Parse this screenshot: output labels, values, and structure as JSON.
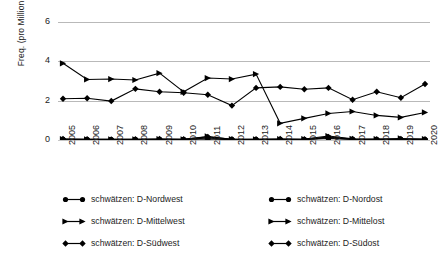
{
  "axes": {
    "ylabel": "Freq. (pro Million Tokens)",
    "yticks": [
      "0",
      "2",
      "4",
      "6"
    ],
    "xticks": [
      "2005",
      "2006",
      "2007",
      "2008",
      "2009",
      "2010",
      "2011",
      "2012",
      "2013",
      "2014",
      "2015",
      "2016",
      "2017",
      "2018",
      "2019",
      "2020"
    ]
  },
  "legend": {
    "items": [
      {
        "label": "schwätzen: D-Nordwest",
        "marker": "circle-marker",
        "column": "left"
      },
      {
        "label": "schwätzen: D-Mittelwest",
        "marker": "triangle-right-marker",
        "column": "left"
      },
      {
        "label": "schwätzen: D-Südwest",
        "marker": "diamond-marker",
        "column": "left"
      },
      {
        "label": "schwätzen: D-Nordost",
        "marker": "circle-marker",
        "column": "right"
      },
      {
        "label": "schwätzen: D-Mittelost",
        "marker": "triangle-right-marker",
        "column": "right"
      },
      {
        "label": "schwätzen: D-Südost",
        "marker": "diamond-marker",
        "column": "right"
      }
    ]
  },
  "colors": {
    "series": "#000000",
    "grid": "#b9b9b9",
    "background": "#ffffff"
  },
  "chart_data": {
    "type": "line",
    "title": "",
    "xlabel": "",
    "ylabel": "Freq. (pro Million Tokens)",
    "x": [
      "2005",
      "2006",
      "2007",
      "2008",
      "2009",
      "2010",
      "2011",
      "2012",
      "2013",
      "2014",
      "2015",
      "2016",
      "2017",
      "2018",
      "2019",
      "2020"
    ],
    "ylim": [
      0,
      6
    ],
    "yticks": [
      0,
      2,
      4,
      6
    ],
    "grid": true,
    "legend_position": "bottom",
    "series": [
      {
        "name": "schwätzen: D-Nordwest",
        "marker": "circle",
        "values": [
          0.03,
          0.02,
          0.02,
          0.02,
          0.03,
          0.02,
          0.05,
          0.02,
          0.02,
          0.03,
          0.02,
          0.08,
          0.03,
          0.02,
          0.02,
          0.02
        ]
      },
      {
        "name": "schwätzen: D-Mittelwest",
        "marker": "triangle-right",
        "values": [
          3.9,
          3.08,
          3.1,
          3.05,
          3.4,
          2.45,
          3.15,
          3.1,
          3.35,
          0.85,
          1.1,
          1.35,
          1.45,
          1.25,
          1.15,
          1.4
        ]
      },
      {
        "name": "schwätzen: D-Südwest",
        "marker": "diamond",
        "values": [
          2.1,
          2.12,
          1.98,
          2.6,
          2.45,
          2.4,
          2.3,
          1.75,
          2.65,
          2.7,
          2.58,
          2.65,
          2.05,
          2.45,
          2.15,
          2.85
        ]
      },
      {
        "name": "schwätzen: D-Nordost",
        "marker": "circle",
        "values": [
          0.02,
          0.02,
          0.01,
          0.02,
          0.02,
          0.02,
          0.1,
          0.02,
          0.02,
          0.02,
          0.02,
          0.12,
          0.03,
          0.02,
          0.02,
          0.02
        ]
      },
      {
        "name": "schwätzen: D-Mittelost",
        "marker": "triangle-right",
        "values": [
          0.04,
          0.03,
          0.03,
          0.03,
          0.04,
          0.03,
          0.18,
          0.04,
          0.03,
          0.04,
          0.05,
          0.2,
          0.06,
          0.05,
          0.08,
          0.05
        ]
      },
      {
        "name": "schwätzen: D-Südost",
        "marker": "diamond",
        "values": [
          0.05,
          0.04,
          0.03,
          0.04,
          0.05,
          0.04,
          0.16,
          0.04,
          0.04,
          0.05,
          0.04,
          0.15,
          0.05,
          0.04,
          0.05,
          0.04
        ]
      }
    ]
  }
}
